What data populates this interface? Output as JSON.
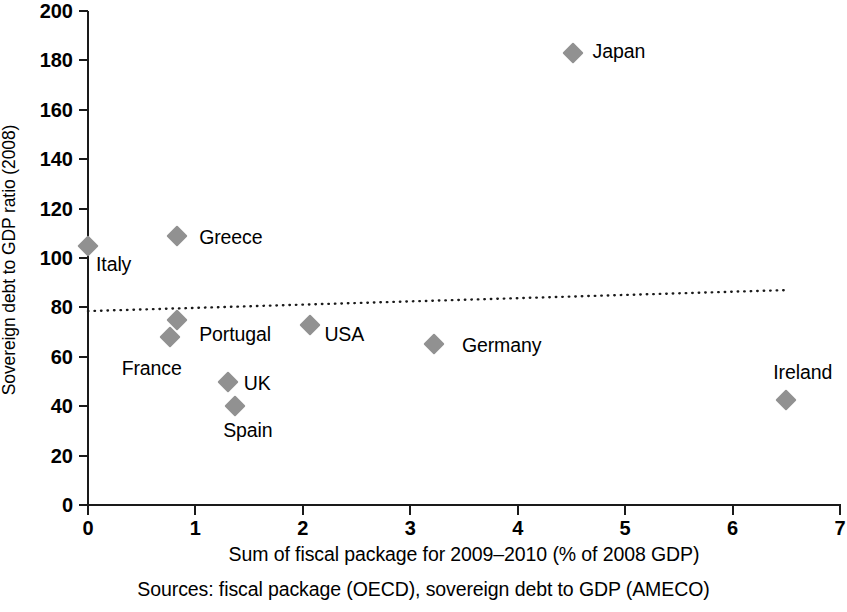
{
  "chart_data": {
    "type": "scatter",
    "title": "",
    "xlabel": "Sum of fiscal package for 2009–2010 (% of 2008 GDP)",
    "ylabel": "Sovereign debt to GDP ratio (2008)",
    "source_note": "Sources: fiscal package (OECD), sovereign debt to GDP (AMECO)",
    "xlim": [
      0,
      7
    ],
    "ylim": [
      0,
      200
    ],
    "xticks": [
      0,
      1,
      2,
      3,
      4,
      5,
      6,
      7
    ],
    "xtick_labels": [
      "0",
      "1",
      "2",
      "3",
      "4",
      "5",
      "6",
      "7"
    ],
    "yticks": [
      0,
      20,
      40,
      60,
      80,
      100,
      120,
      140,
      160,
      180,
      200
    ],
    "ytick_labels": [
      "0",
      "20",
      "40",
      "60",
      "80",
      "100",
      "120",
      "140",
      "160",
      "180",
      "200"
    ],
    "grid": false,
    "legend": "none",
    "marker_color": "#919191",
    "marker_shape": "diamond",
    "axis_color": "#1a1a1a",
    "trendline": {
      "style": "dotted",
      "color": "#1a1a1a",
      "x_start": 0.0,
      "y_start": 78.5,
      "x_end": 6.5,
      "y_end": 87.0
    },
    "points": [
      {
        "label": "Italy",
        "x": 0.0,
        "y": 105.0,
        "label_dx": 8,
        "label_dy": 18
      },
      {
        "label": "Greece",
        "x": 0.83,
        "y": 109.0,
        "label_dx": 22,
        "label_dy": 1
      },
      {
        "label": "Portugal",
        "x": 0.83,
        "y": 75.0,
        "label_dx": 22,
        "label_dy": 14
      },
      {
        "label": "France",
        "x": 0.76,
        "y": 68.0,
        "label_dx": -48,
        "label_dy": 31
      },
      {
        "label": "UK",
        "x": 1.3,
        "y": 50.0,
        "label_dx": 16,
        "label_dy": 1
      },
      {
        "label": "Spain",
        "x": 1.37,
        "y": 40.0,
        "label_dx": -12,
        "label_dy": 24
      },
      {
        "label": "USA",
        "x": 2.07,
        "y": 73.0,
        "label_dx": 14,
        "label_dy": 9
      },
      {
        "label": "Germany",
        "x": 3.22,
        "y": 65.0,
        "label_dx": 28,
        "label_dy": 1
      },
      {
        "label": "Japan",
        "x": 4.51,
        "y": 183.0,
        "label_dx": 20,
        "label_dy": -2
      },
      {
        "label": "Ireland",
        "x": 6.5,
        "y": 42.5,
        "label_dx": -13,
        "label_dy": -28
      }
    ]
  }
}
